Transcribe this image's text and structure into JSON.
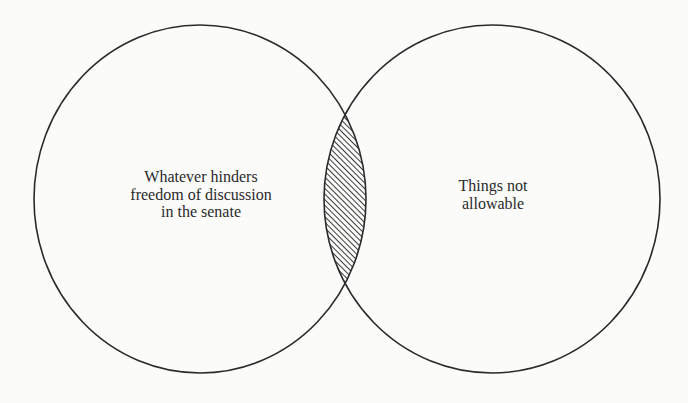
{
  "diagram": {
    "type": "venn",
    "colors": {
      "background": "#fbfbfa",
      "stroke": "#2a2a2a",
      "hatch": "#3a3a3a"
    },
    "sets": [
      {
        "id": "left",
        "label_lines": [
          "Whatever hinders",
          "freedom of discussion",
          "in the senate"
        ]
      },
      {
        "id": "right",
        "label_lines": [
          "Things not",
          "allowable"
        ]
      }
    ],
    "intersection": {
      "shading": "diagonal-hatch"
    }
  }
}
